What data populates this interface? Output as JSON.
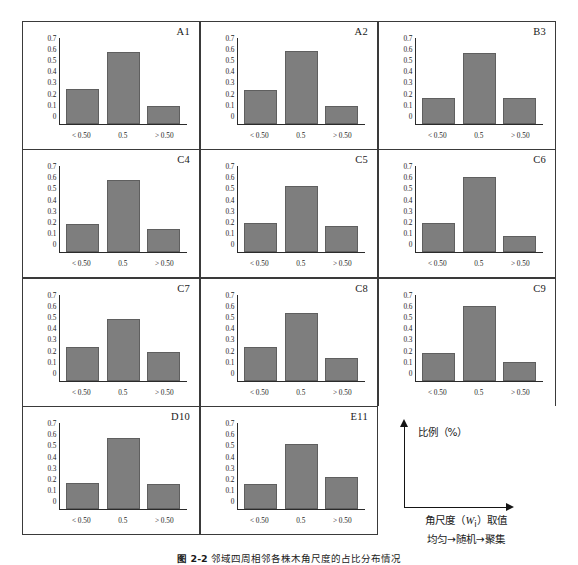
{
  "figure": {
    "caption_number": "图 2-2",
    "caption_text": "邻域四周相邻各株木角尺度的占比分布情况",
    "y_ticks": [
      "0.7",
      "0.6",
      "0.5",
      "0.4",
      "0.3",
      "0.2",
      "0.1",
      "0"
    ],
    "x_categories": [
      "< 0.50",
      "0.5",
      "> 0.50"
    ],
    "y_max": 0.7,
    "bar_color": "#7e7e7e",
    "frame_color": "#3a3a3a"
  },
  "legend": {
    "y_axis_label": "比例（%）",
    "x_axis_label_line1_pre": "角尺度（",
    "x_axis_label_sub": "W",
    "x_axis_label_subscript": "i",
    "x_axis_label_line1_post": "）取值",
    "x_axis_label_line2": "均匀→随机→聚集"
  },
  "chart_data": {
    "type": "bar",
    "title": "邻域四周相邻各株木角尺度的占比分布情况",
    "xlabel": "角尺度（Wi）取值  均匀→随机→聚集",
    "ylabel": "比例（%）",
    "ylim": [
      0,
      0.7
    ],
    "grid": false,
    "legend": "none",
    "categories": [
      "< 0.50",
      "0.5",
      "> 0.50"
    ],
    "panels": [
      {
        "label": "A1",
        "values": [
          0.28,
          0.58,
          0.14
        ]
      },
      {
        "label": "A2",
        "values": [
          0.27,
          0.59,
          0.14
        ]
      },
      {
        "label": "B3",
        "values": [
          0.21,
          0.57,
          0.21
        ]
      },
      {
        "label": "C4",
        "values": [
          0.23,
          0.59,
          0.19
        ]
      },
      {
        "label": "C5",
        "values": [
          0.24,
          0.54,
          0.21
        ]
      },
      {
        "label": "C6",
        "values": [
          0.24,
          0.61,
          0.13
        ]
      },
      {
        "label": "C7",
        "values": [
          0.27,
          0.5,
          0.23
        ]
      },
      {
        "label": "C8",
        "values": [
          0.27,
          0.55,
          0.18
        ]
      },
      {
        "label": "C9",
        "values": [
          0.22,
          0.61,
          0.15
        ]
      },
      {
        "label": "D10",
        "values": [
          0.21,
          0.58,
          0.2
        ]
      },
      {
        "label": "E11",
        "values": [
          0.2,
          0.53,
          0.26
        ]
      }
    ]
  }
}
